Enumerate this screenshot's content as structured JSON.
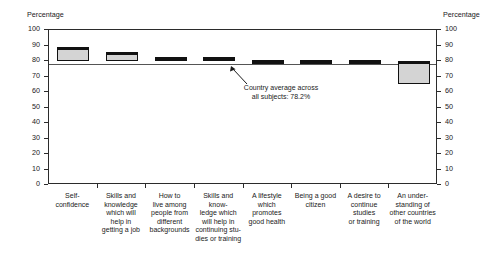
{
  "chart_data": {
    "type": "bar",
    "title": "",
    "xlabel": "",
    "ylabel": "Percentage",
    "ylim": [
      0,
      100
    ],
    "ytick_step": 10,
    "grid": false,
    "legend": "none",
    "axis_caption_left": "Percentage",
    "axis_caption_right": "Percentage",
    "ytick_labels": [
      "100",
      "90",
      "80",
      "70",
      "60",
      "50",
      "40",
      "30",
      "20",
      "10",
      "0"
    ],
    "categories": [
      "Self-confidence",
      "Skills and knowledge which will help in getting a job",
      "How to live among people from different backgrounds",
      "Skills and know-ledge which will help in continuing stu-dies or training",
      "A lifestyle which promotes good health",
      "Being a good citizen",
      "A desire to continue studies or training",
      "An under-standing of other countries of the world"
    ],
    "category_lines": [
      [
        "Self-",
        "confidence"
      ],
      [
        "Skills and",
        "knowledge",
        "which will",
        "help in",
        "getting a job"
      ],
      [
        "How to",
        "live among",
        "people from",
        "different",
        "backgrounds"
      ],
      [
        "Skills and know-",
        "ledge which",
        "will help in",
        "continuing stu-",
        "dies or training"
      ],
      [
        "A lifestyle",
        "which",
        "promotes",
        "good health"
      ],
      [
        "Being a good",
        "citizen"
      ],
      [
        "A desire to",
        "continue",
        "studies",
        "or training"
      ],
      [
        "An under-",
        "standing of",
        "other countries",
        "of the world"
      ]
    ],
    "values": [
      89,
      86,
      82.5,
      82.5,
      80.5,
      80.5,
      80.5,
      80
    ],
    "bar_bottoms": [
      80,
      80,
      81,
      81,
      79.5,
      79.5,
      79.5,
      65
    ],
    "reference_line": {
      "value": 78.2,
      "label_line1": "Country average across",
      "label_line2": "all subjects: 78.2%"
    },
    "colors": {
      "bar_fill": "#d4d4d4",
      "bar_edge": "#111111",
      "axis": "#2b2b2b",
      "reference_line": "#555555",
      "text": "#1a1a1a",
      "background": "#ffffff"
    }
  }
}
